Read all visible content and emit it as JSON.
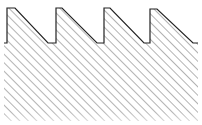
{
  "diagram": {
    "type": "sawtooth-profile-section",
    "tooth_count": 4,
    "outline_color": "#222222",
    "hatch_color": "#8a8a8a",
    "background": "#ffffff",
    "hatch": {
      "angle_deg": 45,
      "spacing_px": 6
    },
    "teeth": [
      {
        "rise_x": 7,
        "top_y": 8,
        "top_end_x": 15,
        "valley_x": 48,
        "valley_end_x": 56
      },
      {
        "rise_x": 56,
        "top_y": 8,
        "top_end_x": 62,
        "valley_x": 97,
        "valley_end_x": 104
      },
      {
        "rise_x": 104,
        "top_y": 8,
        "top_end_x": 110,
        "valley_x": 144,
        "valley_end_x": 150
      },
      {
        "rise_x": 150,
        "top_y": 9,
        "top_end_x": 157,
        "valley_x": 193,
        "valley_end_x": 198
      }
    ],
    "valley_y": 43,
    "body": {
      "left": 4,
      "right": 198,
      "bottom": 121
    }
  }
}
